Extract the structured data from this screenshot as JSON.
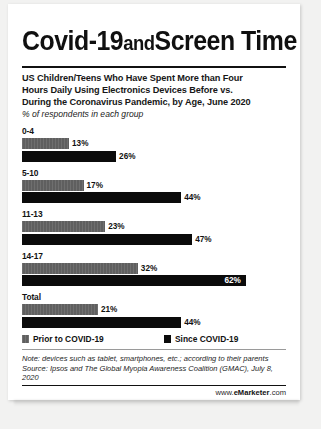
{
  "title": {
    "part1": "Covid-19",
    "part2": "and",
    "part3": "Screen Time"
  },
  "subtitle": {
    "line1": "US Children/Teens Who Have Spent More than Four",
    "line2": "Hours Daily Using Electronics Devices Before vs.",
    "line3": "During the Coronavirus Pandemic, by Age, June 2020",
    "unit": "% of respondents in each group"
  },
  "legend": {
    "prior_label": "Prior to COVID-19",
    "since_label": "Since COVID-19",
    "prior_color": "#5f5f5f",
    "since_color": "#0b0b0b"
  },
  "footer": {
    "note_line1": "Note: devices such as tablet, smartphones, etc.; according to their parents",
    "note_line2": "Source: Ipsos and The Global Myopia Awareness Coalition (GMAC), July 8,",
    "note_line3": "2020",
    "url_prefix": "www.",
    "url_brand": "eMarketer",
    "url_suffix": ".com"
  },
  "chart_data": {
    "type": "bar",
    "orientation": "horizontal",
    "subtitle": "US Children/Teens Who Have Spent More than Four Hours Daily Using Electronics Devices Before vs. During the Coronavirus Pandemic, by Age, June 2020",
    "xlabel": "% of respondents in each group",
    "ylabel": "Age",
    "categories": [
      "0-4",
      "5-10",
      "11-13",
      "14-17",
      "Total"
    ],
    "series": [
      {
        "name": "Prior to COVID-19",
        "color": "#5f5f5f",
        "values": [
          13,
          17,
          23,
          32,
          21
        ]
      },
      {
        "name": "Since COVID-19",
        "color": "#0b0b0b",
        "values": [
          26,
          44,
          47,
          62,
          44
        ]
      }
    ],
    "value_labels": [
      [
        "13%",
        "17%",
        "23%",
        "32%",
        "21%"
      ],
      [
        "26%",
        "44%",
        "47%",
        "62%",
        "44%"
      ]
    ],
    "xlim": [
      0,
      62
    ],
    "grid": false,
    "legend_position": "bottom",
    "annotations": [
      "Note: devices such as tablet, smartphones, etc.; according to their parents",
      "Source: Ipsos and The Global Myopia Awareness Coalition (GMAC), July 8, 2020"
    ]
  }
}
